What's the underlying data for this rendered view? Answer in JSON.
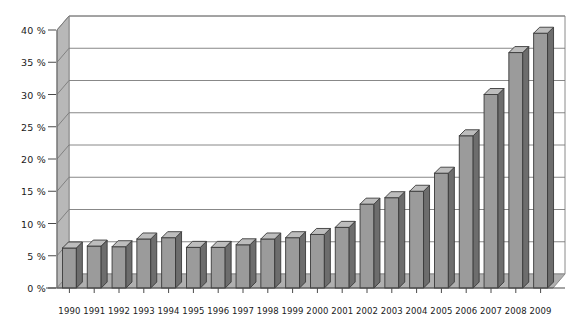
{
  "chart_data": {
    "type": "bar",
    "title": "",
    "subtitle": "",
    "xlabel": "",
    "ylabel": "",
    "categories": [
      "1990",
      "1991",
      "1992",
      "1993",
      "1994",
      "1995",
      "1996",
      "1997",
      "1998",
      "1999",
      "2000",
      "2001",
      "2002",
      "2003",
      "2004",
      "2005",
      "2006",
      "2007",
      "2008",
      "2009"
    ],
    "values": [
      6.2,
      6.5,
      6.4,
      7.6,
      7.8,
      6.3,
      6.3,
      6.7,
      7.6,
      7.8,
      8.3,
      9.4,
      13.0,
      14.0,
      15.0,
      17.8,
      23.6,
      30.0,
      36.5,
      39.5
    ],
    "series": [
      {
        "name": "share",
        "values": [
          6.2,
          6.5,
          6.4,
          7.6,
          7.8,
          6.3,
          6.3,
          6.7,
          7.6,
          7.8,
          8.3,
          9.4,
          13.0,
          14.0,
          15.0,
          17.8,
          23.6,
          30.0,
          36.5,
          39.5
        ]
      }
    ],
    "ylim": [
      0,
      40
    ],
    "ytick_values": [
      0,
      5,
      10,
      15,
      20,
      25,
      30,
      35,
      40
    ],
    "ytick_labels": [
      "0 %",
      "5 %",
      "10 %",
      "15 %",
      "20 %",
      "25 %",
      "30 %",
      "35 %",
      "40 %"
    ],
    "grid": true,
    "legend": "none",
    "style": "3d-column",
    "colors": {
      "bar_front": "#9b9b9b",
      "bar_side": "#6d6d6d",
      "bar_top": "#bdbdbd",
      "bar_outline": "#3a3a3a",
      "wall": "#b8b8b8",
      "floor": "#b0b0b0",
      "gridline": "#7a7a7a",
      "frame": "#8a8a8a",
      "background": "#ffffff",
      "text": "#1a1a1a"
    },
    "annotations": []
  },
  "axis": {
    "y_title": "",
    "x_title": ""
  }
}
